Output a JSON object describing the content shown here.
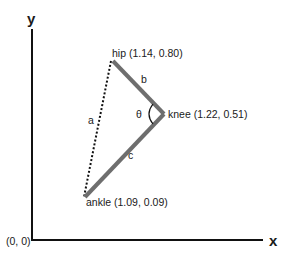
{
  "diagram": {
    "axes": {
      "x_label": "x",
      "y_label": "y",
      "origin_label": "(0, 0)"
    },
    "points": {
      "hip": {
        "label": "hip (1.14, 0.80)",
        "name": "hip",
        "x": 1.14,
        "y": 0.8
      },
      "knee": {
        "label": "knee (1.22, 0.51)",
        "name": "knee",
        "x": 1.22,
        "y": 0.51
      },
      "ankle": {
        "label": "ankle (1.09, 0.09)",
        "name": "ankle",
        "x": 1.09,
        "y": 0.09
      }
    },
    "segments": {
      "a": {
        "label": "a",
        "from": "hip",
        "to": "ankle",
        "style": "dotted"
      },
      "b": {
        "label": "b",
        "from": "hip",
        "to": "knee",
        "style": "solid-thick"
      },
      "c": {
        "label": "c",
        "from": "knee",
        "to": "ankle",
        "style": "solid-thick"
      }
    },
    "angle": {
      "label": "θ",
      "at": "knee"
    },
    "colors": {
      "axis": "#111111",
      "limb": "#6e6e6e",
      "dotted": "#111111",
      "text": "#1a1a1a"
    }
  }
}
